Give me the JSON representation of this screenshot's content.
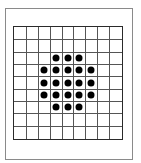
{
  "figure": {
    "type": "dot-grid",
    "grid": {
      "rows": 9,
      "cols": 9
    },
    "colors": {
      "frame": "#8a8a8a",
      "grid_border": "#2a2a2a",
      "grid_line": "#555555",
      "dot": "#000000"
    },
    "dots": [
      [
        2,
        3
      ],
      [
        2,
        4
      ],
      [
        2,
        5
      ],
      [
        3,
        2
      ],
      [
        3,
        3
      ],
      [
        3,
        4
      ],
      [
        3,
        5
      ],
      [
        3,
        6
      ],
      [
        4,
        2
      ],
      [
        4,
        3
      ],
      [
        4,
        4
      ],
      [
        4,
        5
      ],
      [
        4,
        6
      ],
      [
        5,
        2
      ],
      [
        5,
        3
      ],
      [
        5,
        4
      ],
      [
        5,
        5
      ],
      [
        5,
        6
      ],
      [
        6,
        3
      ],
      [
        6,
        4
      ],
      [
        6,
        5
      ]
    ],
    "dot_count": 21
  }
}
